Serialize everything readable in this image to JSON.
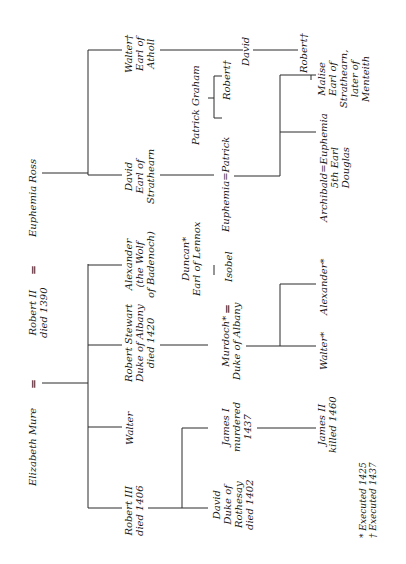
{
  "diagram": {
    "type": "genealogy",
    "orientation": "rotated-90-ccw",
    "generation0": {
      "elizabeth_mure": "Elizabeth Mure",
      "marriage_sign_1": "=",
      "robert_ii": [
        "Robert II",
        "died 1390"
      ],
      "marriage_sign_2": "=",
      "euphemia_ross": "Euphemia Ross"
    },
    "generation1": {
      "robert_iii": [
        "Robert III",
        "died 1406"
      ],
      "walter": [
        "Walter"
      ],
      "robert_stewart": [
        "Robert Stewart",
        "Duke of Albany",
        "died 1420"
      ],
      "alexander_wolf": [
        "Alexander",
        "(the Wolf",
        "of Badenoch)"
      ],
      "david_strathearn": [
        "David",
        "Earl of",
        "Strathearn"
      ],
      "walter_atholl": [
        "Walter†",
        "Earl of",
        "Atholl"
      ]
    },
    "generation2": {
      "david_rothesay": [
        "David",
        "Duke of",
        "Rothesay",
        "died 1402"
      ],
      "james_i": [
        "James I",
        "murdered",
        "1437"
      ],
      "murdoch": [
        "Murdoch*",
        "Duke of Albany"
      ],
      "murdoch_marriage_sign": "=",
      "duncan_lennox": [
        "Duncan*",
        "Earl of Lennox"
      ],
      "isobel": "Isobel",
      "euphemia_patrick": "Euphemia=Patrick",
      "patrick_graham": "Patrick Graham",
      "robert_graham": "Robert†",
      "david_atholl_son": "David"
    },
    "generation3": {
      "james_ii": [
        "James II",
        "killed 1460"
      ],
      "walter_albany": "Walter*",
      "alexander_albany": "Alexander*",
      "archibald_euphemia": [
        "Archibald=Euphemia",
        "5th Earl",
        "Douglas"
      ],
      "malise": [
        "Malise",
        "Earl of",
        "Strathearn,",
        "later of",
        "Menteith"
      ],
      "robert_atholl_grandson": "Robert†"
    },
    "legend": {
      "executed_1425": "* Executed 1425",
      "executed_1437": "† Executed 1437"
    }
  }
}
